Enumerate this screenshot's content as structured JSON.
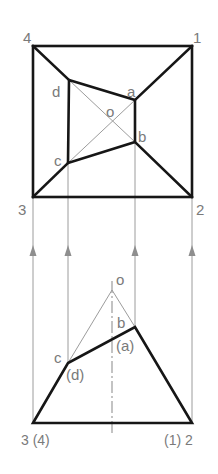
{
  "diagram": {
    "top_view": {
      "corner_labels": {
        "c1": "1",
        "c2": "2",
        "c3": "3",
        "c4": "4"
      },
      "point_labels": {
        "a": "a",
        "b": "b",
        "c": "c",
        "d": "d",
        "o": "o"
      }
    },
    "front_view": {
      "labels": {
        "apex": "o",
        "b": "b",
        "a_hidden": "(a)",
        "c": "c",
        "d_hidden": "(d)",
        "left_base": "3 (4)",
        "right_base": "(1) 2"
      }
    },
    "colors": {
      "outline": "#161616",
      "construction": "#9c9c9c",
      "label": "#7a7a7a"
    }
  }
}
